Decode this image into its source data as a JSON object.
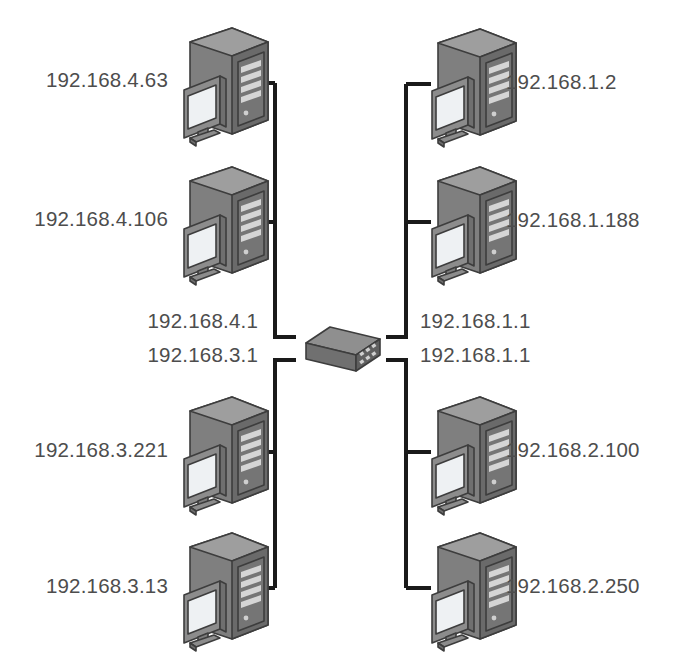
{
  "diagram": {
    "background_color": "#ffffff",
    "label_color": "#4d4d4d",
    "wire_color": "#1a1a1a",
    "device_colors": {
      "tower_front": "#7f7f7f",
      "tower_side": "#6b6b6b",
      "tower_top": "#9a9a9a",
      "monitor_bezel": "#8c8c8c",
      "monitor_screen": "#eef1f3",
      "switch_top": "#8a8a8a",
      "switch_front": "#707070",
      "switch_side": "#5f5f5f",
      "outline": "#3d3d3d"
    }
  },
  "switch": {
    "icon": "network-switch-icon",
    "gateways": {
      "top_left": "192.168.4.1",
      "bottom_left": "192.168.3.1",
      "top_right": "192.168.1.1",
      "bottom_right": "192.168.1.1"
    }
  },
  "hosts": {
    "top_left": [
      {
        "ip": "192.168.4.63",
        "icon": "desktop-computer-icon"
      },
      {
        "ip": "192.168.4.106",
        "icon": "desktop-computer-icon"
      }
    ],
    "top_right": [
      {
        "ip": "192.168.1.2",
        "icon": "desktop-computer-icon"
      },
      {
        "ip": "192.168.1.188",
        "icon": "desktop-computer-icon"
      }
    ],
    "bottom_left": [
      {
        "ip": "192.168.3.221",
        "icon": "desktop-computer-icon"
      },
      {
        "ip": "192.168.3.13",
        "icon": "desktop-computer-icon"
      }
    ],
    "bottom_right": [
      {
        "ip": "192.168.2.100",
        "icon": "desktop-computer-icon"
      },
      {
        "ip": "192.168.2.250",
        "icon": "desktop-computer-icon"
      }
    ]
  }
}
